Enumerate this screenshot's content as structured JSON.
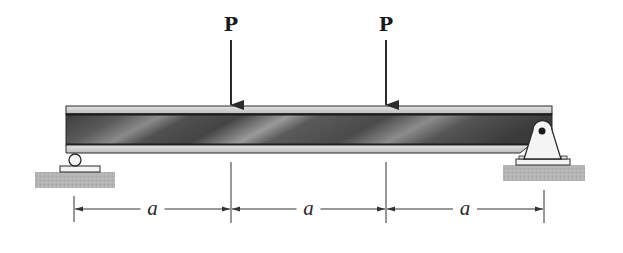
{
  "diagram": {
    "type": "simply-supported-beam",
    "beam": {
      "label": "beam"
    },
    "loads": [
      {
        "label": "P",
        "direction": "down",
        "position_fraction": 0.3333
      },
      {
        "label": "P",
        "direction": "down",
        "position_fraction": 0.6667
      }
    ],
    "supports": [
      {
        "type": "roller",
        "side": "left"
      },
      {
        "type": "pin",
        "side": "right"
      }
    ],
    "dimensions": [
      {
        "label": "a"
      },
      {
        "label": "a"
      },
      {
        "label": "a"
      }
    ],
    "colors": {
      "outline": "#2b2b2b",
      "flange": "#cfcfcf",
      "web_dark": "#4a4a4a",
      "web_light": "#bdbdbd",
      "ground": "#b0b0b0",
      "support_fill": "#f2f2f2"
    }
  }
}
